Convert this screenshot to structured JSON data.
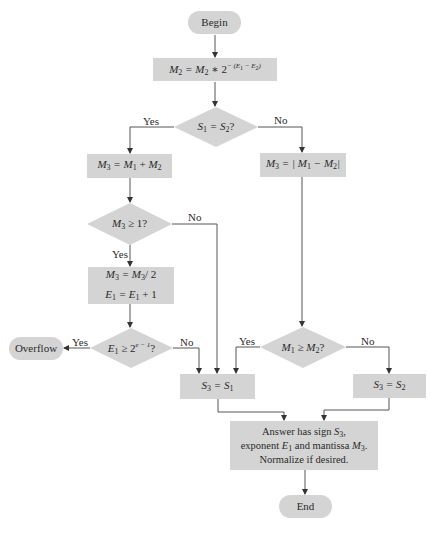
{
  "diagram": {
    "type": "flowchart",
    "title": "",
    "colors": {
      "node_fill": "#d4d4d4",
      "line": "#555555",
      "background": "#ffffff"
    },
    "nodes": {
      "begin": {
        "shape": "terminal",
        "label": "Begin"
      },
      "align": {
        "shape": "process",
        "label": "M2 = M2 * 2^-(E1 - E2)"
      },
      "sign_check": {
        "shape": "decision",
        "label": "S1 = S2?"
      },
      "add": {
        "shape": "process",
        "label": "M3 = M1 + M2"
      },
      "subtract": {
        "shape": "process",
        "label": "M3 = |M1 - M2|"
      },
      "carry_check": {
        "shape": "decision",
        "label": "M3 ≥ 1?"
      },
      "normalize_shift": {
        "shape": "process",
        "label_line1": "M3 = M3/2",
        "label_line2": "E1 = E1 + 1"
      },
      "overflow_check": {
        "shape": "decision",
        "label": "E1 ≥ 2^(e-1)?"
      },
      "overflow": {
        "shape": "terminal",
        "label": "Overflow"
      },
      "magnitude_check": {
        "shape": "decision",
        "label": "M1 ≥ M2?"
      },
      "sign_s1": {
        "shape": "process",
        "label": "S3 = S1"
      },
      "sign_s2": {
        "shape": "process",
        "label": "S3 = S2"
      },
      "result": {
        "shape": "process",
        "line1": "Answer has sign S3,",
        "line2": "exponent E1 and mantissa M3.",
        "line3": "Normalize if desired."
      },
      "end": {
        "shape": "terminal",
        "label": "End"
      }
    },
    "edge_labels": {
      "sign_yes": "Yes",
      "sign_no": "No",
      "carry_no": "No",
      "carry_yes": "Yes",
      "overflow_yes": "Yes",
      "overflow_no": "No",
      "magnitude_yes": "Yes",
      "magnitude_no": "No"
    },
    "edges": [
      [
        "begin",
        "align",
        ""
      ],
      [
        "align",
        "sign_check",
        ""
      ],
      [
        "sign_check",
        "add",
        "Yes"
      ],
      [
        "sign_check",
        "subtract",
        "No"
      ],
      [
        "add",
        "carry_check",
        ""
      ],
      [
        "carry_check",
        "normalize_shift",
        "Yes"
      ],
      [
        "carry_check",
        "sign_s1",
        "No"
      ],
      [
        "normalize_shift",
        "overflow_check",
        ""
      ],
      [
        "overflow_check",
        "overflow",
        "Yes"
      ],
      [
        "overflow_check",
        "sign_s1",
        "No"
      ],
      [
        "subtract",
        "magnitude_check",
        ""
      ],
      [
        "magnitude_check",
        "sign_s1",
        "Yes"
      ],
      [
        "magnitude_check",
        "sign_s2",
        "No"
      ],
      [
        "sign_s1",
        "result",
        ""
      ],
      [
        "sign_s2",
        "result",
        ""
      ],
      [
        "result",
        "end",
        ""
      ]
    ]
  }
}
